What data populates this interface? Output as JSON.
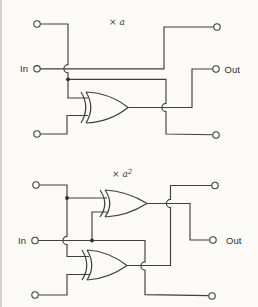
{
  "figure": {
    "type": "circuit-diagram",
    "background_color": "#fbfaf6",
    "line_color": "#3f3f3f",
    "circuits": [
      {
        "id": "multiply-by-a",
        "label": "× a",
        "exponent": "",
        "input_label": "In",
        "output_label": "Out",
        "xor_gate_count": 1,
        "terminal_count": 6
      },
      {
        "id": "multiply-by-a-squared",
        "label": "× a",
        "exponent": "2",
        "input_label": "In",
        "output_label": "Out",
        "xor_gate_count": 2,
        "terminal_count": 6
      }
    ]
  }
}
